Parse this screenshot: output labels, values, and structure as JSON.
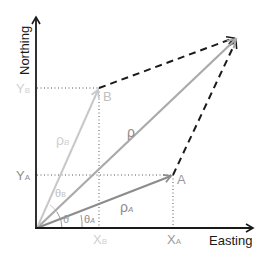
{
  "diagram": {
    "axes": {
      "x_label": "Easting",
      "y_label": "Northing"
    },
    "points": {
      "A": "A",
      "B": "B"
    },
    "ticks": {
      "x_b": "X",
      "x_b_sub": "B",
      "x_a": "X",
      "x_a_sub": "A",
      "y_b": "Y",
      "y_b_sub": "B",
      "y_a": "Y",
      "y_a_sub": "A"
    },
    "vectors": {
      "rho": "ρ",
      "rho_a": "ρ",
      "rho_a_sub": "A",
      "rho_b": "ρ",
      "rho_b_sub": "B"
    },
    "angles": {
      "theta": "θ",
      "theta_a": "θ",
      "theta_a_sub": "A",
      "theta_b": "θ",
      "theta_b_sub": "B"
    },
    "colors": {
      "axis": "#1a1a1a",
      "rho_a": "#8c8c8c",
      "rho_b": "#c8c8c8",
      "rho": "#aaaaaa",
      "dashed": "#1a1a1a",
      "label_gray": "#9a9a9a",
      "label_light": "#c8c8c8"
    }
  }
}
